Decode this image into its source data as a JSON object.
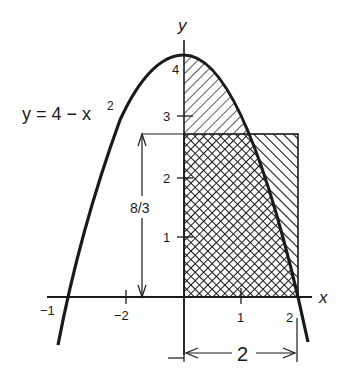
{
  "figure": {
    "equation_label": "y = 4 − x",
    "equation_exponent": "2",
    "axis_x_label": "x",
    "axis_y_label": "y",
    "x_ticks": [
      {
        "label": "−1"
      },
      {
        "label": "−2"
      },
      {
        "label": "1"
      },
      {
        "label": "2"
      }
    ],
    "y_ticks": [
      {
        "label": "1"
      },
      {
        "label": "2"
      },
      {
        "label": "3"
      },
      {
        "label": "4"
      }
    ],
    "height_dimension_label": "8/3",
    "width_dimension_label": "2",
    "colors": {
      "ink": "#1a1a1a",
      "background": "#ffffff"
    }
  }
}
